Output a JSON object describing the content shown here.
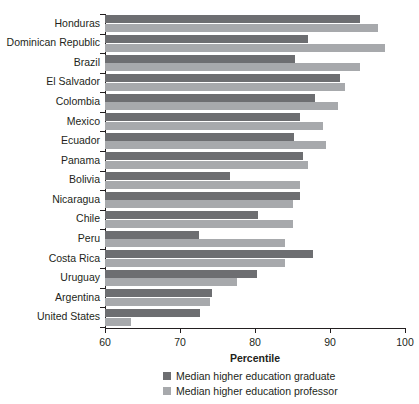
{
  "chart_data": {
    "type": "bar",
    "orientation": "horizontal",
    "title": "",
    "xlabel": "Percentile",
    "ylabel": "",
    "xlim": [
      60,
      100
    ],
    "xticks": [
      60,
      70,
      80,
      90,
      100
    ],
    "grid": false,
    "legend_position": "bottom",
    "categories": [
      "Honduras",
      "Dominican Republic",
      "Brazil",
      "El Salvador",
      "Colombia",
      "Mexico",
      "Ecuador",
      "Panama",
      "Bolivia",
      "Nicaragua",
      "Chile",
      "Peru",
      "Costa Rica",
      "Uruguay",
      "Argentina",
      "United States"
    ],
    "series": [
      {
        "name": "Median higher education graduate",
        "color": "#6d6e71",
        "values": [
          94.0,
          87.0,
          85.3,
          91.3,
          88.0,
          86.0,
          85.2,
          86.4,
          76.7,
          86.0,
          80.4,
          72.5,
          87.7,
          80.3,
          74.3,
          72.7
        ]
      },
      {
        "name": "Median higher education professor",
        "color": "#a7a9ac",
        "values": [
          96.4,
          97.3,
          94.0,
          92.0,
          91.0,
          89.0,
          89.5,
          87.0,
          86.0,
          85.0,
          85.0,
          84.0,
          84.0,
          77.6,
          74.0,
          63.5
        ]
      }
    ]
  },
  "axis": {
    "x_title": "Percentile",
    "tick_labels": [
      "60",
      "70",
      "80",
      "90",
      "100"
    ]
  },
  "legend": {
    "items": [
      {
        "label": "Median higher education graduate",
        "color": "#6d6e71",
        "swatch": "graduate"
      },
      {
        "label": "Median higher education professor",
        "color": "#a7a9ac",
        "swatch": "professor"
      }
    ]
  },
  "colors": {
    "graduate": "#6d6e71",
    "professor": "#a7a9ac",
    "axis": "#231f20",
    "background": "#ffffff"
  }
}
